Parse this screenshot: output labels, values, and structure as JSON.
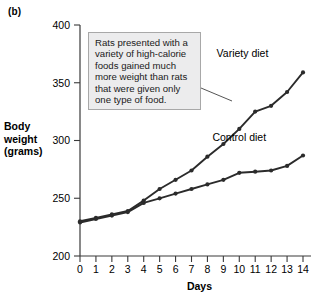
{
  "panel": {
    "label": "(b)"
  },
  "annotation": {
    "text": "Rats presented with a variety of high-calorie foods gained much more weight than rats that were given only one type of food."
  },
  "chart_data": {
    "type": "line",
    "title": "",
    "xlabel": "Days",
    "ylabel": "Body weight (grams)",
    "ylabel_lines": [
      "Body",
      "weight",
      "(grams)"
    ],
    "x": [
      0,
      1,
      2,
      3,
      4,
      5,
      6,
      7,
      8,
      9,
      10,
      11,
      12,
      13,
      14
    ],
    "xticklabels": [
      "0",
      "1",
      "2",
      "3",
      "4",
      "5",
      "6",
      "7",
      "8",
      "9",
      "10",
      "11",
      "12",
      "13",
      "14"
    ],
    "yticks": [
      200,
      250,
      300,
      350,
      400
    ],
    "yticklabels": [
      "200",
      "250",
      "300",
      "350",
      "400"
    ],
    "xlim": [
      0,
      14
    ],
    "ylim": [
      200,
      400
    ],
    "grid": false,
    "legend_position": "inline-labels",
    "series": [
      {
        "name": "Variety diet",
        "color": "#2b2b2b",
        "label_x": 10.2,
        "label_y": 372,
        "values": [
          230,
          233,
          236,
          239,
          248,
          258,
          266,
          274,
          286,
          297,
          310,
          325,
          330,
          342,
          359
        ]
      },
      {
        "name": "Control diet",
        "color": "#2b2b2b",
        "label_x": 10.0,
        "label_y": 300,
        "values": [
          229,
          232,
          235,
          238,
          246,
          250,
          254,
          258,
          262,
          266,
          272,
          273,
          274,
          278,
          287
        ]
      }
    ]
  }
}
